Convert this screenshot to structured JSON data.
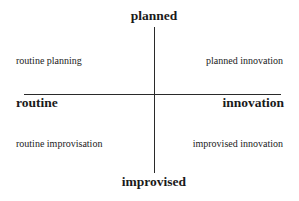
{
  "diagram": {
    "type": "quadrant",
    "axes": {
      "vertical": {
        "top": "planned",
        "bottom": "improvised"
      },
      "horizontal": {
        "left": "routine",
        "right": "innovation"
      }
    },
    "quadrants": {
      "top_left": "routine planning",
      "top_right": "planned innovation",
      "bottom_left": "routine improvisation",
      "bottom_right": "improvised innovation"
    },
    "colors": {
      "background": "#ffffff",
      "line": "#2a2a2a",
      "text": "#1a1a1a"
    }
  }
}
